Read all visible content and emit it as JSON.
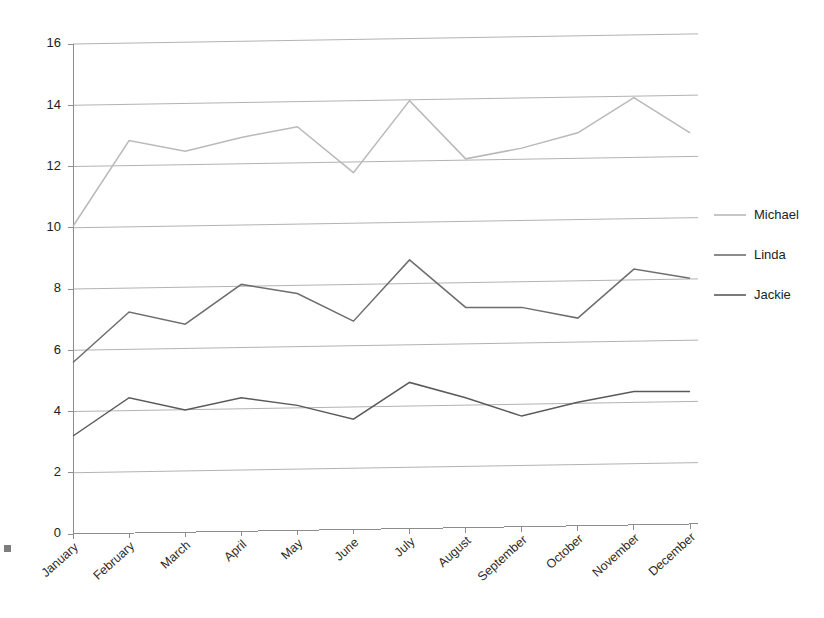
{
  "chart_data": {
    "type": "line",
    "title": "",
    "subtitle": "",
    "xlabel": "",
    "ylabel": "",
    "categories": [
      "January",
      "February",
      "March",
      "April",
      "May",
      "June",
      "July",
      "August",
      "September",
      "October",
      "November",
      "December"
    ],
    "series": [
      {
        "name": "Michael",
        "color": "#b9b9b9",
        "values": [
          10.05,
          12.85,
          12.5,
          12.95,
          13.3,
          11.8,
          14.15,
          12.25,
          12.6,
          13.1,
          14.25,
          13.1
        ]
      },
      {
        "name": "Linda",
        "color": "#6e6e6e",
        "values": [
          5.6,
          7.25,
          6.85,
          8.15,
          7.85,
          6.95,
          8.95,
          7.4,
          7.4,
          7.05,
          8.65,
          8.35
        ]
      },
      {
        "name": "Jackie",
        "color": "#5a5a5a",
        "values": [
          3.2,
          4.45,
          4.05,
          4.45,
          4.2,
          3.75,
          4.95,
          4.45,
          3.85,
          4.3,
          4.65,
          4.65
        ]
      }
    ],
    "ylim": [
      0,
      16
    ],
    "yticks": [
      0,
      2,
      4,
      6,
      8,
      10,
      12,
      14,
      16
    ],
    "ytick_labels": [
      "0",
      "2",
      "4",
      "6",
      "8",
      "10",
      "12",
      "14",
      "16"
    ],
    "grid": true,
    "grid_axis": "y",
    "legend_position": "right",
    "legend_entries": [
      "Michael",
      "Linda",
      "Jackie"
    ],
    "annotations": []
  },
  "colors": {
    "background": "#ffffff",
    "axis": "#8d8d8d",
    "grid": "#a9a9a9",
    "text": "#222222"
  }
}
